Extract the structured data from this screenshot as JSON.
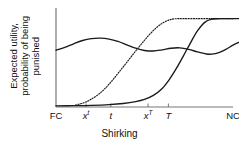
{
  "chart_data": {
    "type": "line",
    "title": "",
    "xlabel": "Shirking",
    "ylabel_line1": "Expected utility,",
    "ylabel_line2": "probability of being",
    "ylabel_line3": "punished",
    "ylabel_full": "Expected utility, probability of being punished",
    "grid": false,
    "legend": "none",
    "xlim": [
      0,
      1
    ],
    "ylim": [
      0,
      1
    ],
    "axis_color": "#777777",
    "curve_color": "#1a1a1a",
    "xticks": [
      {
        "label": "FC",
        "pos": 0.0,
        "italic": false,
        "sup": ""
      },
      {
        "label": "x",
        "pos": 0.17,
        "italic": true,
        "sup": "t"
      },
      {
        "label": "t",
        "pos": 0.31,
        "italic": true,
        "sup": ""
      },
      {
        "label": "x",
        "pos": 0.52,
        "italic": true,
        "sup": "T"
      },
      {
        "label": "T",
        "pos": 0.635,
        "italic": true,
        "sup": ""
      },
      {
        "label": "NC",
        "pos": 1.0,
        "italic": false,
        "sup": ""
      }
    ],
    "yticks": [],
    "series": [
      {
        "name": "expected-utility",
        "style": "solid",
        "points": [
          [
            0.0,
            0.61
          ],
          [
            0.05,
            0.64
          ],
          [
            0.1,
            0.68
          ],
          [
            0.15,
            0.715
          ],
          [
            0.2,
            0.735
          ],
          [
            0.25,
            0.74
          ],
          [
            0.3,
            0.73
          ],
          [
            0.35,
            0.705
          ],
          [
            0.4,
            0.668
          ],
          [
            0.45,
            0.632
          ],
          [
            0.5,
            0.608
          ],
          [
            0.55,
            0.602
          ],
          [
            0.6,
            0.615
          ],
          [
            0.65,
            0.632
          ],
          [
            0.7,
            0.636
          ],
          [
            0.75,
            0.62
          ],
          [
            0.8,
            0.592
          ],
          [
            0.85,
            0.57
          ],
          [
            0.88,
            0.568
          ],
          [
            0.92,
            0.585
          ],
          [
            0.96,
            0.62
          ],
          [
            1.0,
            0.665
          ],
          [
            1.04,
            0.7
          ]
        ]
      },
      {
        "name": "probability-of-punishment-dotted",
        "style": "dotted",
        "points": [
          [
            0.11,
            0.022
          ],
          [
            0.14,
            0.035
          ],
          [
            0.17,
            0.055
          ],
          [
            0.2,
            0.085
          ],
          [
            0.24,
            0.135
          ],
          [
            0.28,
            0.205
          ],
          [
            0.32,
            0.29
          ],
          [
            0.36,
            0.385
          ],
          [
            0.4,
            0.48
          ],
          [
            0.44,
            0.578
          ],
          [
            0.48,
            0.672
          ],
          [
            0.52,
            0.762
          ],
          [
            0.56,
            0.84
          ],
          [
            0.6,
            0.9
          ],
          [
            0.64,
            0.936
          ],
          [
            0.67,
            0.948
          ],
          [
            0.72,
            0.95
          ],
          [
            0.8,
            0.95
          ],
          [
            0.88,
            0.95
          ],
          [
            0.96,
            0.95
          ],
          [
            1.0,
            0.95
          ]
        ]
      },
      {
        "name": "probability-of-punishment-solid",
        "style": "solid",
        "points": [
          [
            0.0,
            0.012
          ],
          [
            0.1,
            0.014
          ],
          [
            0.2,
            0.018
          ],
          [
            0.3,
            0.026
          ],
          [
            0.38,
            0.038
          ],
          [
            0.45,
            0.058
          ],
          [
            0.5,
            0.082
          ],
          [
            0.55,
            0.125
          ],
          [
            0.6,
            0.2
          ],
          [
            0.64,
            0.295
          ],
          [
            0.68,
            0.415
          ],
          [
            0.72,
            0.55
          ],
          [
            0.76,
            0.69
          ],
          [
            0.8,
            0.82
          ],
          [
            0.84,
            0.91
          ],
          [
            0.88,
            0.945
          ],
          [
            0.92,
            0.95
          ]
        ]
      },
      {
        "name": "punishment-plateau-solid",
        "style": "solid",
        "points": [
          [
            0.88,
            0.95
          ],
          [
            1.0,
            0.95
          ],
          [
            1.08,
            0.95
          ]
        ]
      }
    ]
  }
}
